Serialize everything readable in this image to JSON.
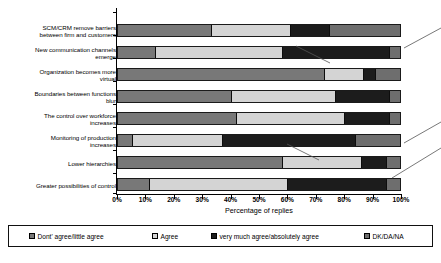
{
  "chart_data": {
    "type": "bar",
    "subtype": "stacked-horizontal-100-percent",
    "title": "",
    "xlabel": "Percentage of replies",
    "ylabel": "",
    "xlim": [
      0,
      100
    ],
    "grid": false,
    "legend_position": "bottom",
    "xticks": [
      "0%",
      "10%",
      "20%",
      "30%",
      "40%",
      "50%",
      "60%",
      "70%",
      "80%",
      "90%",
      "100%"
    ],
    "xtick_values": [
      0,
      10,
      20,
      30,
      40,
      50,
      60,
      70,
      80,
      90,
      100
    ],
    "categories": [
      "SCM/CRM remove barriers between firm and customers",
      "New communication channels emerge",
      "Organization becomes more virtual",
      "Boundaries between functions blur",
      "The control over workforce increases",
      "Monitoring of production increases",
      "Lower hierarchies",
      "Greater possibilities of control"
    ],
    "category_lines": [
      [
        "SCM/CRM remove barriers",
        "between firm and customers"
      ],
      [
        "New communication channels",
        "emerge"
      ],
      [
        "Organization becomes more",
        "virtual"
      ],
      [
        "Boundaries between functions",
        "blur"
      ],
      [
        "The control over workforce",
        "increases"
      ],
      [
        "Monitoring of production",
        "increases"
      ],
      [
        "Lower hierarchies"
      ],
      [
        "Greater possibilities of control"
      ]
    ],
    "series": [
      {
        "name": "Dont' agree/little agree",
        "color": "#787878",
        "values": [
          33,
          13,
          73,
          40,
          42,
          5,
          58,
          11
        ]
      },
      {
        "name": "Agree",
        "color": "#d4d4d4",
        "values": [
          28,
          45,
          14,
          37,
          38,
          32,
          28,
          49
        ]
      },
      {
        "name": "very much agree/absolutely agree",
        "color": "#1c1c1c",
        "values": [
          14,
          38,
          4,
          19,
          16,
          47,
          9,
          35
        ]
      },
      {
        "name": "DK/DA/NA",
        "color": "#6e6e6e",
        "values": [
          25,
          4,
          9,
          4,
          4,
          16,
          5,
          5
        ]
      }
    ]
  },
  "legend": {
    "items": [
      {
        "label": "Dont' agree/little agree",
        "swatch": "s0"
      },
      {
        "label": "Agree",
        "swatch": "s1"
      },
      {
        "label": "very much agree/absolutely agree",
        "swatch": "s2"
      },
      {
        "label": "DK/DA/NA",
        "swatch": "s3"
      }
    ]
  }
}
